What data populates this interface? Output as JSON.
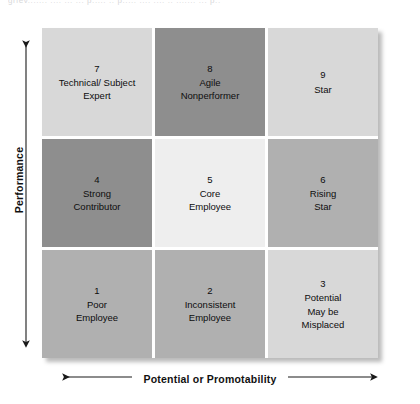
{
  "top_sliver_text": "griev....... .... ... ... p..... .. p..... .... .... .. .......  ... p..",
  "axes": {
    "y": {
      "label": "Performance",
      "arrow_icon": "double-headed-vertical-arrow"
    },
    "x": {
      "label": "Potential or Promotability",
      "arrow_icon": "double-headed-horizontal-arrow"
    }
  },
  "colors": {
    "lightest": "#eeeeee",
    "light": "#d8d8d8",
    "medium": "#b0b0b0",
    "dark": "#8e8e8e",
    "text": "#0d0d0d",
    "page_background": "#ffffff"
  },
  "matrix": {
    "rows": 3,
    "cols": 3,
    "cells": [
      {
        "number": "7",
        "name": "Technical/ Subject\nExpert",
        "shade": "light",
        "color": "#d8d8d8",
        "row": 0,
        "col": 0
      },
      {
        "number": "8",
        "name": "Agile\nNonperformer",
        "shade": "dark",
        "color": "#8e8e8e",
        "row": 0,
        "col": 1
      },
      {
        "number": "9",
        "name": "Star",
        "shade": "light",
        "color": "#d8d8d8",
        "row": 0,
        "col": 2
      },
      {
        "number": "4",
        "name": "Strong\nContributor",
        "shade": "dark",
        "color": "#8e8e8e",
        "row": 1,
        "col": 0
      },
      {
        "number": "5",
        "name": "Core\nEmployee",
        "shade": "lightest",
        "color": "#eeeeee",
        "row": 1,
        "col": 1
      },
      {
        "number": "6",
        "name": "Rising\nStar",
        "shade": "medium",
        "color": "#b0b0b0",
        "row": 1,
        "col": 2
      },
      {
        "number": "1",
        "name": "Poor\nEmployee",
        "shade": "medium",
        "color": "#b0b0b0",
        "row": 2,
        "col": 0
      },
      {
        "number": "2",
        "name": "Inconsistent\nEmployee",
        "shade": "medium",
        "color": "#b0b0b0",
        "row": 2,
        "col": 1
      },
      {
        "number": "3",
        "name": "Potential\nMay be\nMisplaced",
        "shade": "light",
        "color": "#d8d8d8",
        "row": 2,
        "col": 2
      }
    ]
  }
}
